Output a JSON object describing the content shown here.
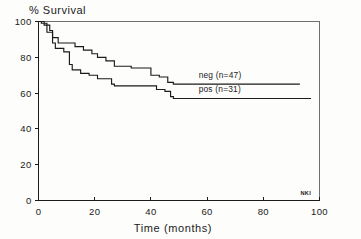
{
  "chart_data": {
    "type": "line",
    "subtype": "kaplan-meier-step",
    "title": "% Survival",
    "xlabel": "Time (months)",
    "ylabel": "",
    "xlim": [
      0,
      100
    ],
    "ylim": [
      0,
      100
    ],
    "xticks": [
      0,
      20,
      40,
      60,
      80,
      100
    ],
    "yticks": [
      0,
      20,
      40,
      60,
      80,
      100
    ],
    "xtick_labels": [
      "0",
      "20",
      "40",
      "60",
      "80",
      "100"
    ],
    "ytick_labels": [
      "0",
      "20",
      "40",
      "60",
      "80",
      "100"
    ],
    "grid": false,
    "legend_position": "inline-right-of-curves",
    "annotations": [
      {
        "text": "NKI",
        "x": 97,
        "y": 3
      }
    ],
    "series": [
      {
        "name": "neg (n=47)",
        "label": "neg (n=47)",
        "n": 47,
        "color": "#1b1b1b",
        "label_x": 57,
        "label_y": 67,
        "points": [
          [
            0,
            100
          ],
          [
            2,
            100
          ],
          [
            2,
            98
          ],
          [
            4,
            98
          ],
          [
            4,
            95
          ],
          [
            5,
            95
          ],
          [
            5,
            91
          ],
          [
            7,
            91
          ],
          [
            7,
            88
          ],
          [
            13,
            88
          ],
          [
            13,
            86
          ],
          [
            16,
            86
          ],
          [
            16,
            84
          ],
          [
            19,
            84
          ],
          [
            19,
            82
          ],
          [
            21,
            82
          ],
          [
            21,
            80
          ],
          [
            24,
            80
          ],
          [
            24,
            78
          ],
          [
            27,
            78
          ],
          [
            27,
            75
          ],
          [
            33,
            75
          ],
          [
            33,
            74
          ],
          [
            40,
            74
          ],
          [
            40,
            70
          ],
          [
            43,
            70
          ],
          [
            43,
            69
          ],
          [
            46,
            69
          ],
          [
            46,
            66
          ],
          [
            48,
            66
          ],
          [
            48,
            65
          ],
          [
            93,
            65
          ]
        ]
      },
      {
        "name": "pos (n=31)",
        "label": "pos (n=31)",
        "n": 31,
        "color": "#1b1b1b",
        "label_x": 57,
        "label_y": 59,
        "points": [
          [
            0,
            100
          ],
          [
            1,
            100
          ],
          [
            1,
            99
          ],
          [
            3,
            99
          ],
          [
            3,
            94
          ],
          [
            5,
            94
          ],
          [
            5,
            88
          ],
          [
            6,
            88
          ],
          [
            6,
            85
          ],
          [
            9,
            85
          ],
          [
            9,
            83
          ],
          [
            11,
            83
          ],
          [
            11,
            76
          ],
          [
            12,
            76
          ],
          [
            12,
            73
          ],
          [
            15,
            73
          ],
          [
            15,
            71
          ],
          [
            18,
            71
          ],
          [
            18,
            70
          ],
          [
            21,
            70
          ],
          [
            21,
            68
          ],
          [
            26,
            68
          ],
          [
            26,
            65
          ],
          [
            27,
            65
          ],
          [
            27,
            64
          ],
          [
            42,
            64
          ],
          [
            42,
            62
          ],
          [
            45,
            62
          ],
          [
            45,
            61
          ],
          [
            47,
            61
          ],
          [
            47,
            58
          ],
          [
            48,
            58
          ],
          [
            48,
            57
          ],
          [
            97,
            57
          ]
        ]
      }
    ]
  }
}
